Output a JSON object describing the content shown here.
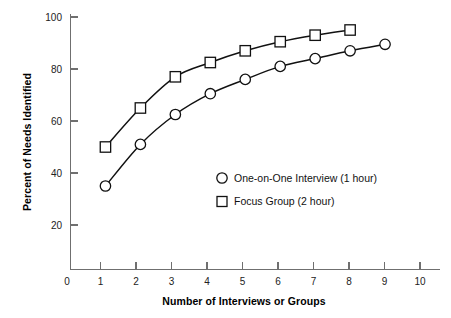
{
  "chart_data": {
    "type": "line",
    "title": "",
    "xlabel": "Number of Interviews or Groups",
    "ylabel": "Percent of Needs Identified",
    "xlim": [
      0,
      10
    ],
    "ylim": [
      0,
      100
    ],
    "xticks": [
      "0",
      "1",
      "2",
      "3",
      "4",
      "5",
      "6",
      "7",
      "8",
      "9",
      "10"
    ],
    "yticks": [
      "20",
      "40",
      "60",
      "80",
      "100"
    ],
    "grid": false,
    "legend_position": "center",
    "series": [
      {
        "name": "One-on-One Interview (1 hour)",
        "marker": "circle",
        "x": [
          1,
          2,
          3,
          4,
          5,
          6,
          7,
          8,
          9
        ],
        "values": [
          35,
          51,
          62.5,
          70.5,
          76,
          81,
          84,
          87,
          89.5
        ]
      },
      {
        "name": "Focus Group (2 hour)",
        "marker": "square",
        "x": [
          1,
          2,
          3,
          4,
          5,
          6,
          7,
          8
        ],
        "values": [
          50,
          65,
          77,
          82.5,
          87,
          90.5,
          93,
          95
        ]
      }
    ]
  },
  "axes": {
    "y_title": "Percent of Needs Identified",
    "x_title": "Number of Interviews or Groups",
    "y_tick_labels": [
      "100",
      "80",
      "60",
      "40",
      "20"
    ],
    "x_tick_labels": [
      "0",
      "1",
      "2",
      "3",
      "4",
      "5",
      "6",
      "7",
      "8",
      "9",
      "10"
    ]
  },
  "legend": {
    "entries": [
      {
        "marker": "circle",
        "label": "One-on-One Interview (1 hour)"
      },
      {
        "marker": "square",
        "label": "Focus Group (2 hour)"
      }
    ]
  },
  "colors": {
    "line": "#111111",
    "axis": "#6f6f6f",
    "text": "#111111",
    "background": "#ffffff"
  }
}
